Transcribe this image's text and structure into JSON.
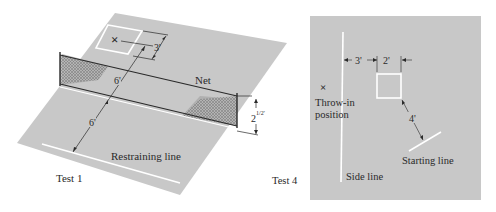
{
  "colors": {
    "background": "#ffffff",
    "floor": "#c8c8c8",
    "lines": "#ffffff",
    "ink": "#2a2a2a",
    "net_shade": "#a8a8a8"
  },
  "test1": {
    "caption": "Test 1",
    "net_label": "Net",
    "restraining_label": "Restraining line",
    "dim_target_to_net": "6'",
    "dim_net_to_restraining": "6'",
    "dim_target_offset": "3'",
    "dim_net_height": "2½'",
    "dim_net_height_whole": "2",
    "dim_net_height_frac": "1/2'",
    "target_marker": "×"
  },
  "test4": {
    "caption": "Test 4",
    "throw_in_marker": "×",
    "throw_in_label_line1": "Throw-in",
    "throw_in_label_line2": "position",
    "side_line_label": "Side line",
    "starting_line_label": "Starting line",
    "dim_sideline_to_box": "3'",
    "dim_box_width": "2'",
    "dim_box_to_start": "4'"
  }
}
